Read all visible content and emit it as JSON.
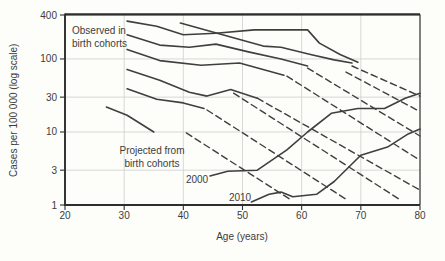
{
  "figure": {
    "width": 445,
    "height": 261,
    "background": "#fdfdfa",
    "line_color": "#3f3f3f",
    "dashed_line_color": "#3f3f3f",
    "grid_color": "#d4d4d0",
    "axis_color": "#2e2e2e",
    "text_color": "#3c3c3c"
  },
  "chart_data": {
    "type": "line",
    "title": "",
    "xlabel": "Age (years)",
    "ylabel": "Cases per 100 000 (log scale)",
    "xlim": [
      20,
      80
    ],
    "ylim": [
      1,
      400
    ],
    "yscale": "log",
    "grid": true,
    "x_ticks": [
      20,
      30,
      40,
      50,
      60,
      70,
      80
    ],
    "y_ticks": [
      400,
      100,
      30,
      10,
      3,
      1
    ],
    "legend": "none",
    "annotations": {
      "observed": {
        "line1": "Observed in",
        "line2": "birth cohorts"
      },
      "projected": {
        "line1": "Projected from",
        "line2": "birth cohorts"
      },
      "y2000": "2000",
      "y2010": "2010"
    },
    "series": [
      {
        "name": "observed-cohort-1",
        "group": "observed",
        "style": "solid",
        "x": [
          30.5,
          35.5,
          40,
          45.5,
          52,
          61,
          63,
          66.5,
          69.5
        ],
        "y": [
          330,
          280,
          215,
          225,
          250,
          250,
          165,
          115,
          90
        ]
      },
      {
        "name": "observed-cohort-2",
        "group": "observed",
        "style": "solid",
        "x": [
          39.5,
          48,
          53.5,
          56.5,
          61.5,
          65.5,
          68.5
        ],
        "y": [
          310,
          200,
          150,
          145,
          115,
          97,
          88
        ]
      },
      {
        "name": "observed-cohort-3",
        "group": "observed",
        "style": "solid",
        "x": [
          30.5,
          36,
          41,
          45.5,
          51,
          56.5,
          61
        ],
        "y": [
          215,
          155,
          145,
          160,
          125,
          100,
          80
        ]
      },
      {
        "name": "observed-cohort-4",
        "group": "observed",
        "style": "solid",
        "x": [
          30.5,
          36,
          43,
          49.5,
          57
        ],
        "y": [
          135,
          95,
          82,
          88,
          60
        ]
      },
      {
        "name": "observed-cohort-5",
        "group": "observed",
        "style": "solid",
        "x": [
          30.5,
          36,
          41,
          44,
          48,
          52.5
        ],
        "y": [
          72,
          51,
          35,
          31,
          38,
          29
        ]
      },
      {
        "name": "observed-cohort-6",
        "group": "observed",
        "style": "solid",
        "x": [
          30.5,
          35.5,
          40,
          43.5
        ],
        "y": [
          39,
          28,
          25,
          21
        ]
      },
      {
        "name": "observed-cohort-7",
        "group": "observed",
        "style": "solid",
        "x": [
          27,
          30.5,
          35
        ],
        "y": [
          22,
          17,
          10
        ]
      },
      {
        "name": "projected-cohort-1",
        "group": "projected",
        "style": "dashed",
        "x": [
          68.5,
          80
        ],
        "y": [
          80,
          31
        ]
      },
      {
        "name": "projected-cohort-2",
        "group": "projected",
        "style": "dashed",
        "x": [
          67.5,
          80
        ],
        "y": [
          66,
          19
        ]
      },
      {
        "name": "projected-cohort-3",
        "group": "projected",
        "style": "dashed",
        "x": [
          61,
          80
        ],
        "y": [
          75,
          8.8
        ]
      },
      {
        "name": "projected-cohort-4",
        "group": "projected",
        "style": "dashed",
        "x": [
          57.5,
          80
        ],
        "y": [
          58,
          4.1
        ]
      },
      {
        "name": "projected-cohort-5",
        "group": "projected",
        "style": "dashed",
        "x": [
          52.5,
          80
        ],
        "y": [
          29,
          1.6
        ]
      },
      {
        "name": "projected-cohort-6",
        "group": "projected",
        "style": "dashed",
        "x": [
          48.5,
          76.5
        ],
        "y": [
          34,
          1.2
        ]
      },
      {
        "name": "projected-cohort-7",
        "group": "projected",
        "style": "dashed",
        "x": [
          44,
          67.5
        ],
        "y": [
          20,
          1.2
        ]
      },
      {
        "name": "projected-cohort-8",
        "group": "projected",
        "style": "dashed",
        "x": [
          40.5,
          58
        ],
        "y": [
          9.7,
          1.2
        ]
      },
      {
        "name": "period-2000",
        "group": "period",
        "style": "solid",
        "x": [
          44.5,
          47.5,
          52.5,
          57.5,
          61,
          65,
          69.5,
          74,
          77.5,
          80
        ],
        "y": [
          2.5,
          2.9,
          3.0,
          5.7,
          10,
          18,
          21,
          21,
          29,
          34
        ]
      },
      {
        "name": "period-2010",
        "group": "period",
        "style": "solid",
        "x": [
          51.5,
          54.5,
          56.5,
          58.5,
          62.5,
          65.5,
          70,
          74.5,
          78,
          80
        ],
        "y": [
          1.1,
          1.4,
          1.5,
          1.3,
          1.4,
          2.1,
          4.8,
          6.2,
          9.4,
          11
        ]
      }
    ]
  }
}
